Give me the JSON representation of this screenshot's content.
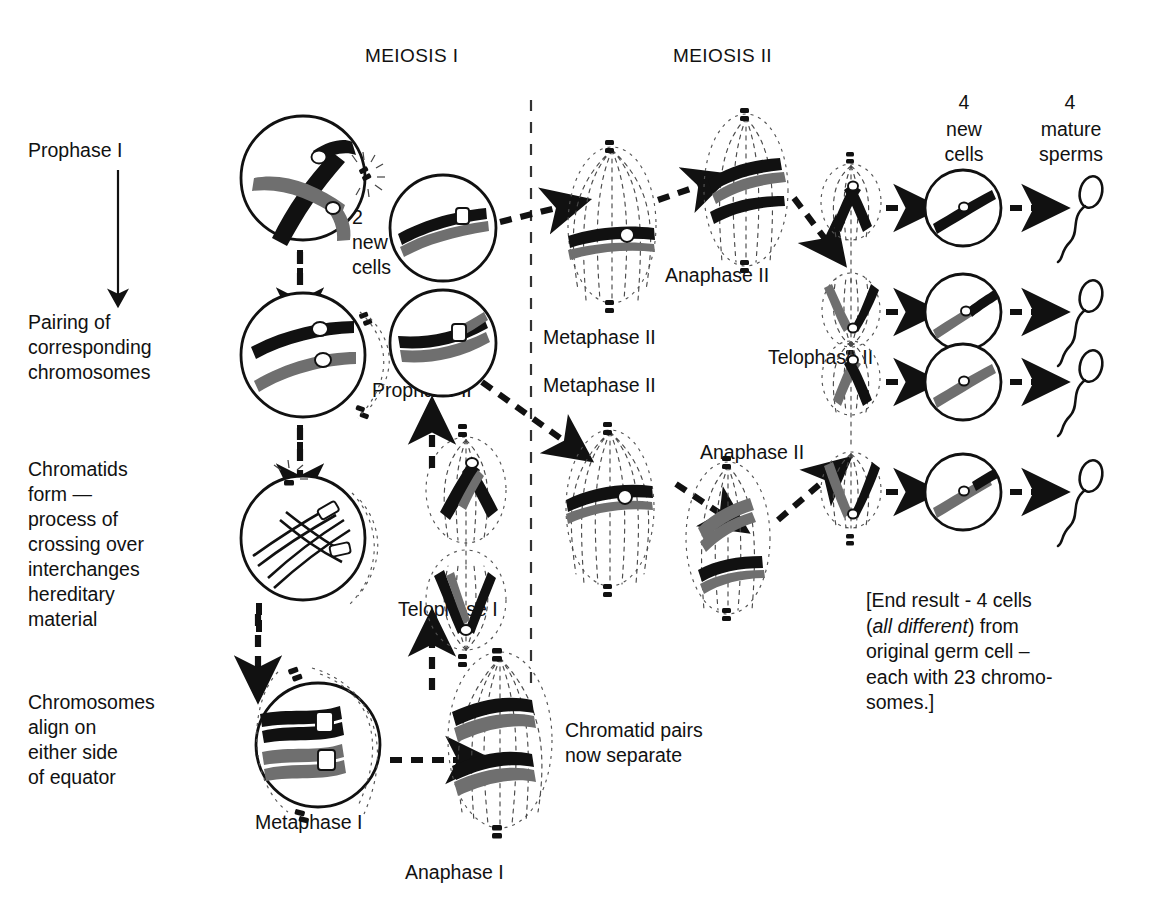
{
  "headers": {
    "meiosis_1": "MEIOSIS I",
    "meiosis_2": "MEIOSIS II"
  },
  "left_column": {
    "prophase_1": "Prophase I",
    "pairing": "Pairing of\ncorresponding\nchromosomes",
    "chromatids": "Chromatids\nform —\nprocess of\ncrossing over\ninterchanges\nhereditary\nmaterial",
    "align": "Chromosomes\nalign on\neither side\nof equator",
    "metaphase_1": "Metaphase I"
  },
  "middle_column": {
    "two_new_cells": "2\nnew\ncells",
    "prophase_2": "Prophase II",
    "telophase_1": "Telophase I",
    "anaphase_1": "Anaphase I",
    "chromatid_pairs": "Chromatid pairs\nnow separate"
  },
  "meiosis2_labels": {
    "metaphase_2_top": "Metaphase II",
    "metaphase_2_bottom": "Metaphase II",
    "anaphase_2_top": "Anaphase II",
    "anaphase_2_bottom": "Anaphase II",
    "telophase_2": "Telophase II"
  },
  "right_column": {
    "new_cells_count": "4",
    "new_cells_label": "new\ncells",
    "sperms_count": "4",
    "sperms_label": "mature\nsperms"
  },
  "end_note": {
    "line1": "[End result - 4 cells",
    "italic": "all different",
    "line2_prefix": "(",
    "line2_suffix": ") from",
    "line3": "original germ cell –",
    "line4": "each with 23 chromo-",
    "line5": "somes.]"
  },
  "colors": {
    "ink": "#111111",
    "chromosome_dark": "#111111",
    "chromosome_gray": "#6f6f6f",
    "background": "#ffffff"
  }
}
